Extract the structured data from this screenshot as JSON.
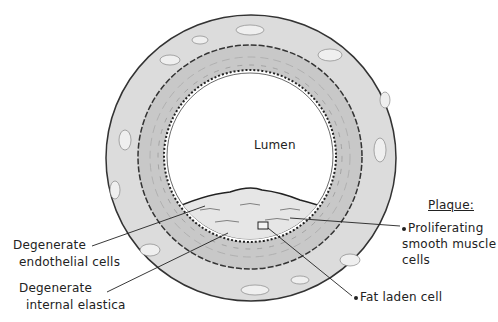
{
  "diagram": {
    "center_label": "Lumen",
    "left_labels": [
      {
        "line1": "Degenerate",
        "line2": "endothelial cells"
      },
      {
        "line1": "Degenerate",
        "line2": "internal elastica"
      }
    ],
    "plaque": {
      "heading": "Plaque:",
      "items": [
        {
          "line1": "Proliferating",
          "line2": "smooth muscle",
          "line3": "cells"
        },
        {
          "line1": "Fat laden cell"
        }
      ]
    },
    "colors": {
      "adventitia": "#d9d9d9",
      "media": "#c9c9c9",
      "lumen": "#ffffff",
      "ink": "#222222"
    }
  }
}
